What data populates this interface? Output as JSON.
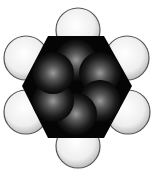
{
  "figure": {
    "atoms": {
      "hydrogen": [
        {
          "cx": 78,
          "cy": 30
        },
        {
          "cx": 127,
          "cy": 58
        },
        {
          "cx": 128,
          "cy": 112
        },
        {
          "cx": 78,
          "cy": 146
        },
        {
          "cx": 26,
          "cy": 112
        },
        {
          "cx": 26,
          "cy": 58
        }
      ],
      "carbon": [
        {
          "cx": 76,
          "cy": 60
        },
        {
          "cx": 100,
          "cy": 73
        },
        {
          "cx": 100,
          "cy": 101
        },
        {
          "cx": 76,
          "cy": 114
        },
        {
          "cx": 53,
          "cy": 101
        },
        {
          "cx": 53,
          "cy": 73
        }
      ]
    },
    "colors": {
      "background": "#ffffff",
      "carbon_body": "#050505",
      "carbon_highlight": "#8a8a8a",
      "hydrogen_fill": "#f2f2f2",
      "hydrogen_edge": "#555555"
    }
  }
}
